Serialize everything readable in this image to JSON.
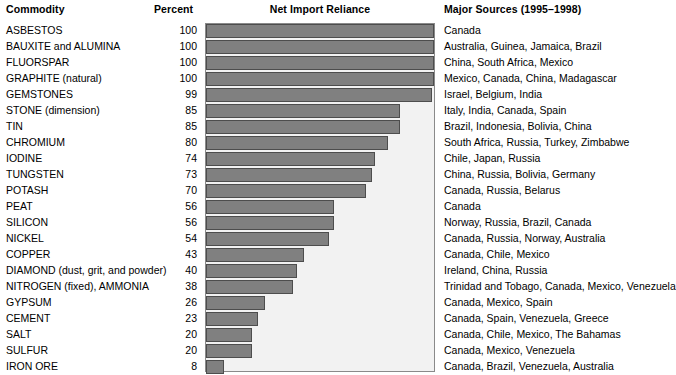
{
  "headers": {
    "commodity": "Commodity",
    "percent": "Percent",
    "chart": "Net Import Reliance",
    "sources": "Major Sources (1995–1998)"
  },
  "colors": {
    "bar_fill": "#808080",
    "bar_stroke": "#4d4d4d",
    "plot_background": "#f2f2f2",
    "plot_border": "#8a8a8a",
    "text": "#000000",
    "page_background": "#ffffff"
  },
  "chart_data": {
    "type": "bar",
    "title": "Net Import Reliance",
    "xlabel": "Percent",
    "ylabel": "Commodity",
    "xlim": [
      0,
      100
    ],
    "grid": false,
    "legend": null,
    "orientation": "horizontal",
    "categories": [
      "ASBESTOS",
      "BAUXITE and ALUMINA",
      "FLUORSPAR",
      "GRAPHITE (natural)",
      "GEMSTONES",
      "STONE (dimension)",
      "TIN",
      "CHROMIUM",
      "IODINE",
      "TUNGSTEN",
      "POTASH",
      "PEAT",
      "SILICON",
      "NICKEL",
      "COPPER",
      "DIAMOND (dust, grit, and powder)",
      "NITROGEN (fixed), AMMONIA",
      "GYPSUM",
      "CEMENT",
      "SALT",
      "SULFUR",
      "IRON ORE"
    ],
    "values": [
      100,
      100,
      100,
      100,
      99,
      85,
      85,
      80,
      74,
      73,
      70,
      56,
      56,
      54,
      43,
      40,
      38,
      26,
      23,
      20,
      20,
      8
    ]
  },
  "rows": [
    {
      "commodity": "ASBESTOS",
      "percent": "100",
      "value": 100,
      "sources": "Canada"
    },
    {
      "commodity": "BAUXITE and ALUMINA",
      "percent": "100",
      "value": 100,
      "sources": "Australia, Guinea, Jamaica, Brazil"
    },
    {
      "commodity": "FLUORSPAR",
      "percent": "100",
      "value": 100,
      "sources": "China, South Africa, Mexico"
    },
    {
      "commodity": "GRAPHITE (natural)",
      "percent": "100",
      "value": 100,
      "sources": "Mexico, Canada, China, Madagascar"
    },
    {
      "commodity": "GEMSTONES",
      "percent": "99",
      "value": 99,
      "sources": "Israel, Belgium, India"
    },
    {
      "commodity": "STONE (dimension)",
      "percent": "85",
      "value": 85,
      "sources": "Italy, India, Canada, Spain"
    },
    {
      "commodity": "TIN",
      "percent": "85",
      "value": 85,
      "sources": "Brazil, Indonesia, Bolivia, China"
    },
    {
      "commodity": "CHROMIUM",
      "percent": "80",
      "value": 80,
      "sources": "South Africa, Russia, Turkey, Zimbabwe"
    },
    {
      "commodity": "IODINE",
      "percent": "74",
      "value": 74,
      "sources": "Chile, Japan, Russia"
    },
    {
      "commodity": "TUNGSTEN",
      "percent": "73",
      "value": 73,
      "sources": "China, Russia, Bolivia, Germany"
    },
    {
      "commodity": "POTASH",
      "percent": "70",
      "value": 70,
      "sources": "Canada, Russia, Belarus"
    },
    {
      "commodity": "PEAT",
      "percent": "56",
      "value": 56,
      "sources": "Canada"
    },
    {
      "commodity": "SILICON",
      "percent": "56",
      "value": 56,
      "sources": "Norway, Russia, Brazil, Canada"
    },
    {
      "commodity": "NICKEL",
      "percent": "54",
      "value": 54,
      "sources": "Canada, Russia, Norway, Australia"
    },
    {
      "commodity": "COPPER",
      "percent": "43",
      "value": 43,
      "sources": "Canada, Chile, Mexico"
    },
    {
      "commodity": "DIAMOND (dust, grit, and powder)",
      "percent": "40",
      "value": 40,
      "sources": "Ireland, China, Russia"
    },
    {
      "commodity": "NITROGEN (fixed), AMMONIA",
      "percent": "38",
      "value": 38,
      "sources": "Trinidad and Tobago, Canada, Mexico, Venezuela"
    },
    {
      "commodity": "GYPSUM",
      "percent": "26",
      "value": 26,
      "sources": "Canada, Mexico, Spain"
    },
    {
      "commodity": "CEMENT",
      "percent": "23",
      "value": 23,
      "sources": "Canada, Spain, Venezuela, Greece"
    },
    {
      "commodity": "SALT",
      "percent": "20",
      "value": 20,
      "sources": "Canada, Chile, Mexico, The Bahamas"
    },
    {
      "commodity": "SULFUR",
      "percent": "20",
      "value": 20,
      "sources": "Canada, Mexico, Venezuela"
    },
    {
      "commodity": "IRON ORE",
      "percent": "8",
      "value": 8,
      "sources": "Canada, Brazil, Venezuela, Australia"
    }
  ]
}
